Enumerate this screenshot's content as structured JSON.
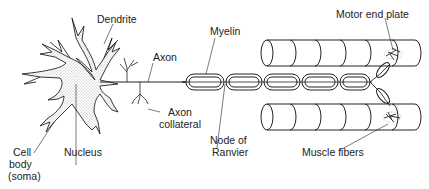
{
  "diagram": {
    "labels": {
      "dendrite": "Dendrite",
      "axon": "Axon",
      "myelin": "Myelin",
      "motor_end_plate": "Motor end plate",
      "cell_body_1": "Cell",
      "cell_body_2": "body",
      "cell_body_3": "(soma)",
      "nucleus": "Nucleus",
      "axon_collateral_1": "Axon",
      "axon_collateral_2": "collateral",
      "node_of_ranvier_1": "Node of",
      "node_of_ranvier_2": "Ranvier",
      "muscle_fibers": "Muscle fibers"
    },
    "colors": {
      "ink": "#222222",
      "background": "#ffffff"
    }
  }
}
